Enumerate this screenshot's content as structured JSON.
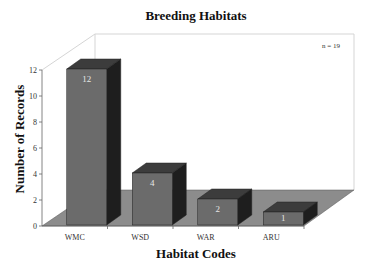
{
  "chart_data": {
    "type": "bar",
    "title": "Breeding Habitats",
    "xlabel": "Habitat Codes",
    "ylabel": "Number of Records",
    "categories": [
      "WMC",
      "WSD",
      "WAR",
      "ARU"
    ],
    "values": [
      12,
      4,
      2,
      1
    ],
    "data_labels": [
      "12",
      "4",
      "2",
      "1"
    ],
    "ylim": [
      0,
      12
    ],
    "yticks": [
      0,
      2,
      4,
      6,
      8,
      10,
      12
    ],
    "annotation": "n = 19",
    "grid": false,
    "legend": null,
    "style": "3d-column"
  },
  "colors": {
    "bar_front": "#6b6b6b",
    "bar_top": "#3c3c3c",
    "bar_side": "#1e1e1e",
    "floor": "#8c8c8c",
    "wall_line": "#d0d0d0"
  }
}
